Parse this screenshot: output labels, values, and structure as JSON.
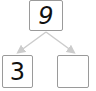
{
  "diagram": {
    "type": "number-bond",
    "whole": "9",
    "parts": [
      "3",
      ""
    ],
    "colors": {
      "border": "#9a9a9a",
      "arrow": "#cccccc",
      "text": "#111111"
    }
  }
}
